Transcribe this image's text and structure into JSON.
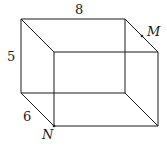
{
  "figure": {
    "type": "rectangular-prism",
    "labels": {
      "length": "8",
      "height": "5",
      "width": "6",
      "point_m": "M",
      "point_n": "N"
    },
    "colors": {
      "stroke": "#1a1a1a",
      "background": "#ffffff"
    }
  }
}
